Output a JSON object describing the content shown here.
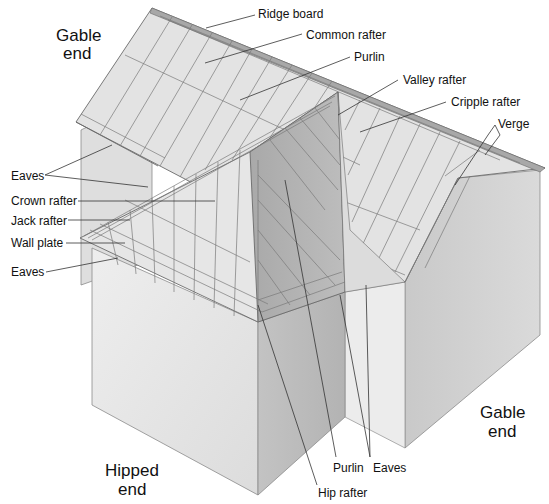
{
  "diagram": {
    "colors": {
      "background": "#ffffff",
      "roof_light": "#e4e4e4",
      "roof_dark": "#b4b4b4",
      "wall_light": "#e9e9e9",
      "wall_mid": "#cfcfcf",
      "wall_dark": "#bdbdbd",
      "line": "#6a6a6a",
      "text": "#111111"
    },
    "region_labels": {
      "gable_end_top_line1": "Gable",
      "gable_end_top_line2": "end",
      "gable_end_right_line1": "Gable",
      "gable_end_right_line2": "end",
      "hipped_end_line1": "Hipped",
      "hipped_end_line2": "end"
    },
    "part_labels": {
      "ridge_board": "Ridge board",
      "common_rafter": "Common rafter",
      "purlin_top": "Purlin",
      "valley_rafter": "Valley rafter",
      "cripple_rafter": "Cripple rafter",
      "verge": "Verge",
      "eaves_upper": "Eaves",
      "crown_rafter": "Crown rafter",
      "jack_rafter": "Jack rafter",
      "wall_plate": "Wall plate",
      "eaves_lower": "Eaves",
      "purlin_bottom": "Purlin",
      "eaves_bottom": "Eaves",
      "hip_rafter": "Hip rafter"
    }
  }
}
